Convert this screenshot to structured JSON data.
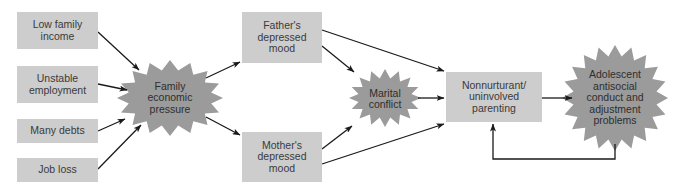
{
  "diagram": {
    "colors": {
      "box_fill": "#cdcdcd",
      "burst_fill": "#9b9b9b",
      "arrow": "#1a1a1a",
      "text": "#333333",
      "background": "#ffffff"
    },
    "causes": [
      {
        "id": "low-family-income",
        "label": "Low family\nincome"
      },
      {
        "id": "unstable-employment",
        "label": "Unstable\nemployment"
      },
      {
        "id": "many-debts",
        "label": "Many debts"
      },
      {
        "id": "job-loss",
        "label": "Job loss"
      }
    ],
    "pressure": {
      "id": "family-economic-pressure",
      "label": "Family\neconomic\npressure"
    },
    "parents": [
      {
        "id": "fathers-depressed-mood",
        "label": "Father's\ndepressed\nmood"
      },
      {
        "id": "mothers-depressed-mood",
        "label": "Mother's\ndepressed\nmood"
      }
    ],
    "conflict": {
      "id": "marital-conflict",
      "label": "Marital\nconflict"
    },
    "parenting": {
      "id": "nonnurturant-parenting",
      "label": "Nonnurturant/\nuninvolved\nparenting"
    },
    "outcome": {
      "id": "adolescent-problems",
      "label": "Adolescent\nantisocial\nconduct and\nadjustment\nproblems"
    },
    "edges": [
      [
        "low-family-income",
        "family-economic-pressure"
      ],
      [
        "unstable-employment",
        "family-economic-pressure"
      ],
      [
        "many-debts",
        "family-economic-pressure"
      ],
      [
        "job-loss",
        "family-economic-pressure"
      ],
      [
        "family-economic-pressure",
        "fathers-depressed-mood"
      ],
      [
        "family-economic-pressure",
        "mothers-depressed-mood"
      ],
      [
        "fathers-depressed-mood",
        "marital-conflict"
      ],
      [
        "fathers-depressed-mood",
        "nonnurturant-parenting"
      ],
      [
        "mothers-depressed-mood",
        "marital-conflict"
      ],
      [
        "mothers-depressed-mood",
        "nonnurturant-parenting"
      ],
      [
        "marital-conflict",
        "nonnurturant-parenting"
      ],
      [
        "nonnurturant-parenting",
        "adolescent-problems"
      ],
      [
        "adolescent-problems",
        "nonnurturant-parenting"
      ]
    ]
  }
}
